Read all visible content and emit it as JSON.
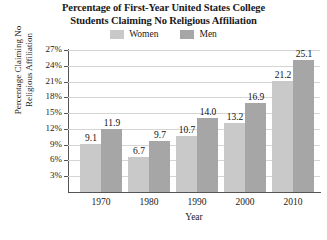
{
  "chart_data": {
    "type": "bar",
    "title": "Percentage of First-Year United States College Students Claiming No Religious Affiliation",
    "title_line1": "Percentage of First-Year United States College",
    "title_line2": "Students Claiming No Religious Affiliation",
    "xlabel": "Year",
    "ylabel": "Percentage Claiming No Religious Affiliation",
    "ylabel_line1": "Percentage Claiming No",
    "ylabel_line2": "Religious Affiliation",
    "categories": [
      "1970",
      "1980",
      "1990",
      "2000",
      "2010"
    ],
    "series": [
      {
        "name": "Women",
        "color": "#c9c9c9",
        "values": [
          9.1,
          6.7,
          10.7,
          13.2,
          21.2
        ],
        "labels": [
          "9.1",
          "6.7",
          "10.7",
          "13.2",
          "21.2"
        ]
      },
      {
        "name": "Men",
        "color": "#a6a6a6",
        "values": [
          11.9,
          9.7,
          14.0,
          16.9,
          25.1
        ],
        "labels": [
          "11.9",
          "9.7",
          "14.0",
          "16.9",
          "25.1"
        ]
      }
    ],
    "ylim": [
      0,
      27
    ],
    "ytick_values": [
      3,
      6,
      9,
      12,
      15,
      18,
      21,
      24,
      27
    ],
    "ytick_labels": [
      "3%",
      "6%",
      "9%",
      "12%",
      "15%",
      "18%",
      "21%",
      "24%",
      "27%"
    ],
    "grid": true,
    "legend_position": "top-center",
    "legend_entries": [
      "Women",
      "Men"
    ]
  }
}
